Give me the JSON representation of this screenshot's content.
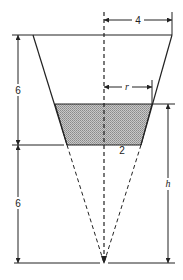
{
  "figure": {
    "type": "truncated-cone-with-liquid",
    "labels": {
      "top_radius": "4",
      "liquid_radius": "r",
      "bottom_radius": "2",
      "upper_height": "6",
      "lower_height": "6",
      "liquid_height": "h"
    },
    "colors": {
      "line": "#222222",
      "shade": "#b8b8b8",
      "background": "#ffffff"
    }
  }
}
